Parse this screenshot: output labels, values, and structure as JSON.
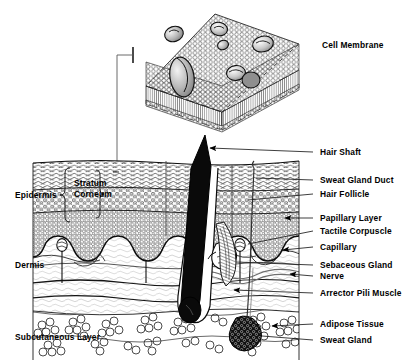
{
  "figure": {
    "width": 419,
    "height": 364,
    "background_color": "#ffffff",
    "ink_color": "#000000",
    "style": "black-and-white line art / stipple engraving"
  },
  "labels": {
    "cell_membrane": "Cell Membrane",
    "hair_shaft": "Hair Shaft",
    "sweat_gland_duct": "Sweat Gland Duct",
    "hair_follicle": "Hair Follicle",
    "papillary_layer": "Papillary Layer",
    "tactile_corpuscle": "Tactile Corpuscle",
    "capillary": "Capillary",
    "sebaceous_gland": "Sebaceous Gland",
    "nerve": "Nerve",
    "arrector_pili_muscle": "Arrector Pili Muscle",
    "adipose_tissue": "Adipose Tissue",
    "sweat_gland": "Sweat Gland",
    "epidermis": "Epidermis",
    "stratum_corneum_line1": "Stratum",
    "stratum_corneum_line2": "Corneum",
    "dermis": "Dermis",
    "subcutaneous_layer": "Subcutaneous Layer"
  },
  "structures": {
    "layers": [
      {
        "name": "Epidermis",
        "side": "left",
        "brace": true
      },
      {
        "name": "Stratum Corneum",
        "side": "left",
        "brace": true
      },
      {
        "name": "Dermis",
        "side": "left",
        "brace": false
      },
      {
        "name": "Subcutaneous Layer",
        "side": "left",
        "brace": false
      }
    ],
    "callouts_right": [
      {
        "name": "Hair Shaft",
        "leader": "line"
      },
      {
        "name": "Sweat Gland Duct",
        "leader": "line"
      },
      {
        "name": "Hair Follicle",
        "leader": "line"
      },
      {
        "name": "Papillary Layer",
        "leader": "arrow"
      },
      {
        "name": "Tactile Corpuscle",
        "leader": "line"
      },
      {
        "name": "Capillary",
        "leader": "arrow"
      },
      {
        "name": "Sebaceous Gland",
        "leader": "line"
      },
      {
        "name": "Nerve",
        "leader": "arrow"
      },
      {
        "name": "Arrector Pili Muscle",
        "leader": "line"
      },
      {
        "name": "Adipose Tissue",
        "leader": "arrow"
      },
      {
        "name": "Sweat Gland",
        "leader": "line"
      }
    ],
    "inset": {
      "name": "Cell Membrane",
      "description": "phospholipid bilayer block with embedded proteins",
      "position": "top center"
    }
  }
}
